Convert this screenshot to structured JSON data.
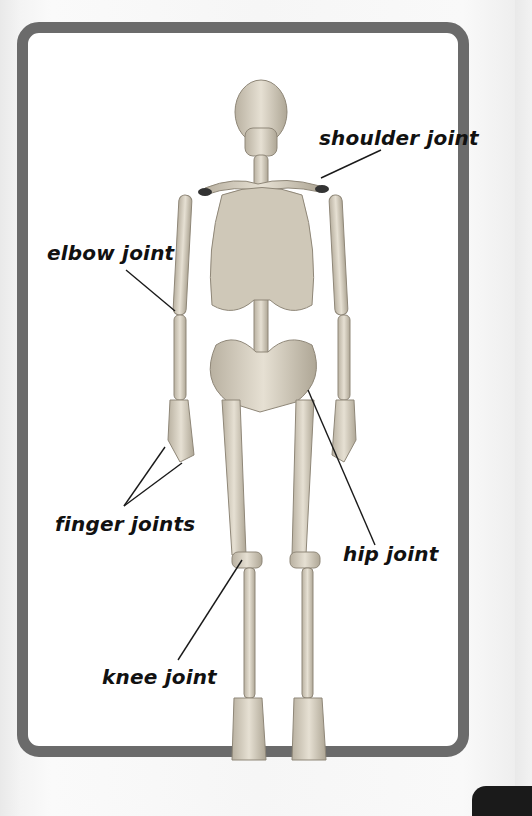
{
  "figure": {
    "colors": {
      "frame": "#6b6b6b",
      "panel": "#ffffff",
      "bone": "#d9d2c3",
      "bone_shadow": "#a8a091",
      "text": "#111111",
      "corner_tab": "#1a1a1a"
    },
    "labels": [
      {
        "id": "shoulder",
        "text": "shoulder joint"
      },
      {
        "id": "elbow",
        "text": "elbow joint"
      },
      {
        "id": "finger",
        "text": "finger joints"
      },
      {
        "id": "hip",
        "text": "hip joint"
      },
      {
        "id": "knee",
        "text": "knee joint"
      }
    ]
  }
}
